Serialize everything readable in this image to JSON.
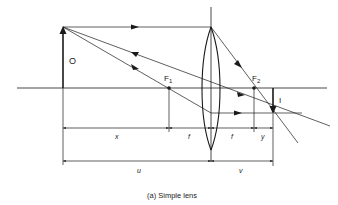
{
  "diagram": {
    "caption": "(a) Simple lens",
    "labels": {
      "object": "O",
      "image": "I",
      "focal_point_1": "F",
      "focal_point_1_sub": "1",
      "focal_point_2": "F",
      "focal_point_2_sub": "2"
    },
    "dimensions": {
      "x": "x",
      "f_left": "f",
      "f_right": "f",
      "y": "y",
      "u": "u",
      "v": "v"
    },
    "colors": {
      "line": "#1a1a1a",
      "background": "#ffffff"
    }
  }
}
